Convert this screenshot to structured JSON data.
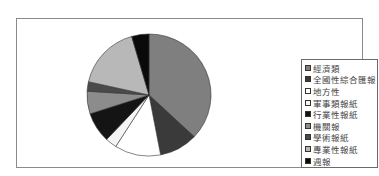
{
  "chart_data": {
    "type": "pie",
    "title": "",
    "categories": [
      "經濟類",
      "全國性綜合匯報",
      "地方性",
      "軍事類報紙",
      "行業性報紙",
      "機關報",
      "學術報紙",
      "專業性報紙",
      "週報"
    ],
    "values": [
      37,
      10,
      12,
      3,
      8,
      6,
      2.5,
      17,
      4.5
    ],
    "unit": "%",
    "colors": [
      "#7f7f7f",
      "#3a3a3a",
      "#ffffff",
      "#f4f4f4",
      "#141414",
      "#8c8c8c",
      "#4a4a4a",
      "#b8b8b8",
      "#0a0a0a"
    ],
    "start_angle": "12 o'clock",
    "direction": "clockwise",
    "legend_position": "right"
  },
  "legend": {
    "items": [
      {
        "label": "經濟類",
        "color": "#7f7f7f"
      },
      {
        "label": "全國性綜合匯報",
        "color": "#3a3a3a"
      },
      {
        "label": "地方性",
        "color": "#ffffff"
      },
      {
        "label": "軍事類報紙",
        "color": "#f4f4f4"
      },
      {
        "label": "行業性報紙",
        "color": "#141414"
      },
      {
        "label": "機關報",
        "color": "#8c8c8c"
      },
      {
        "label": "學術報紙",
        "color": "#4a4a4a"
      },
      {
        "label": "專業性報紙",
        "color": "#b8b8b8"
      },
      {
        "label": "週報",
        "color": "#0a0a0a"
      }
    ]
  }
}
